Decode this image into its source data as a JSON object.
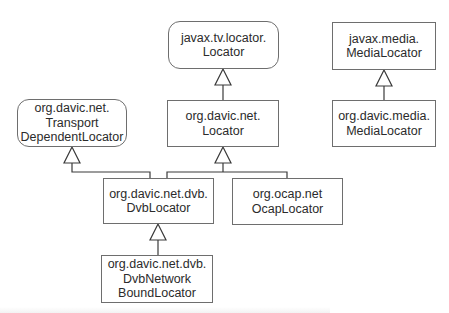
{
  "diagram": {
    "type": "uml-class-inheritance",
    "nodes": [
      {
        "id": "javax-tv-locator-locator",
        "kind": "interface",
        "lines": [
          "javax.tv.locator.",
          "Locator"
        ],
        "box": {
          "x": 168,
          "y": 21,
          "w": 111,
          "h": 48
        }
      },
      {
        "id": "org-davic-net-locator",
        "kind": "class",
        "lines": [
          "org.davic.net.",
          "Locator"
        ],
        "box": {
          "x": 167,
          "y": 100,
          "w": 112,
          "h": 47
        }
      },
      {
        "id": "org-davic-net-transport-dependent-locator",
        "kind": "interface",
        "lines": [
          "org.davic.net.",
          "Transport",
          "DependentLocator"
        ],
        "box": {
          "x": 17,
          "y": 99,
          "w": 110,
          "h": 48
        }
      },
      {
        "id": "javax-media-media-locator",
        "kind": "class",
        "lines": [
          "javax.media.",
          "MediaLocator"
        ],
        "box": {
          "x": 332,
          "y": 22,
          "w": 104,
          "h": 48
        }
      },
      {
        "id": "org-davic-media-media-locator",
        "kind": "class",
        "lines": [
          "org.davic.media.",
          "MediaLocator"
        ],
        "box": {
          "x": 332,
          "y": 100,
          "w": 104,
          "h": 47
        }
      },
      {
        "id": "org-davic-net-dvb-dvb-locator",
        "kind": "class",
        "lines": [
          "org.davic.net.dvb.",
          "DvbLocator"
        ],
        "box": {
          "x": 103,
          "y": 178,
          "w": 111,
          "h": 46
        }
      },
      {
        "id": "org-ocap-net-ocap-locator",
        "kind": "class",
        "lines": [
          "org.ocap.net",
          "OcapLocator"
        ],
        "box": {
          "x": 232,
          "y": 178,
          "w": 111,
          "h": 47
        }
      },
      {
        "id": "org-davic-net-dvb-dvb-network-bound-locator",
        "kind": "class",
        "lines": [
          "org.davic.net.dvb.",
          "DvbNetwork",
          "BoundLocator"
        ],
        "box": {
          "x": 101,
          "y": 255,
          "w": 112,
          "h": 48
        }
      }
    ],
    "edges": [
      {
        "from": "org-davic-net-locator",
        "to": "javax-tv-locator-locator",
        "relation": "generalization"
      },
      {
        "from": "org-davic-media-media-locator",
        "to": "javax-media-media-locator",
        "relation": "generalization"
      },
      {
        "from": "org-davic-net-dvb-dvb-locator",
        "to": "org-davic-net-transport-dependent-locator",
        "relation": "generalization"
      },
      {
        "from": "org-davic-net-dvb-dvb-locator",
        "to": "org-davic-net-locator",
        "relation": "generalization"
      },
      {
        "from": "org-ocap-net-ocap-locator",
        "to": "org-davic-net-locator",
        "relation": "generalization"
      },
      {
        "from": "org-davic-net-dvb-dvb-network-bound-locator",
        "to": "org-davic-net-dvb-dvb-locator",
        "relation": "generalization"
      }
    ],
    "colors": {
      "stroke": "#3a3a3a",
      "box_border": "#6e6e6e",
      "text": "#2b2b2b",
      "background": "#ffffff"
    }
  }
}
